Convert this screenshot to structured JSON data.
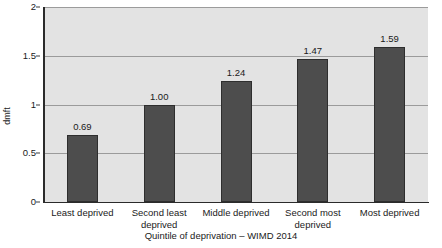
{
  "chart_data": {
    "type": "bar",
    "title": "",
    "subtitle": "",
    "xlabel": "Quintile of deprivation – WIMD 2014",
    "ylabel": "dmft",
    "categories": [
      "Least deprived",
      "Second least deprived",
      "Middle deprived",
      "Second most deprived",
      "Most deprived"
    ],
    "values": [
      0.69,
      1.0,
      1.24,
      1.47,
      1.59
    ],
    "value_labels": [
      "0.69",
      "1.00",
      "1.24",
      "1.47",
      "1.59"
    ],
    "ylim": [
      0,
      2
    ],
    "yticks": [
      0,
      0.5,
      1,
      1.5,
      2
    ],
    "ytick_labels": [
      "0",
      "0.5",
      "1",
      "1.5",
      "2"
    ],
    "grid": "horizontal",
    "legend": "none",
    "colors": {
      "bar_fill": "#4d4d4d",
      "bar_edge": "#2e2e2e",
      "plot_background": "#e3e3e3",
      "gridline": "#9b9b9b",
      "axis_line": "#2b2b2b",
      "text": "#1a1a1a",
      "page_background": "#ffffff"
    }
  },
  "axes": {
    "y_title": "dmft",
    "x_title": "Quintile of deprivation – WIMD 2014"
  }
}
